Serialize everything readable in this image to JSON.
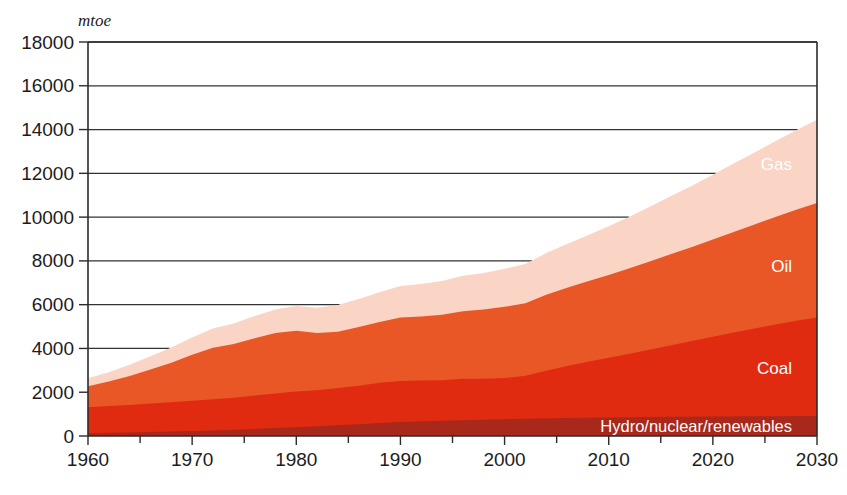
{
  "chart_data": {
    "type": "area",
    "stacked": true,
    "title": "",
    "subtitle": "",
    "xlabel": "",
    "ylabel": "mtoe",
    "unit_label": "mtoe",
    "xlim": [
      1960,
      2030
    ],
    "ylim": [
      0,
      18000
    ],
    "grid": true,
    "legend_position": "inline-right",
    "x_ticks": [
      1960,
      1970,
      1980,
      1990,
      2000,
      2010,
      2020,
      2030
    ],
    "x_tick_labels": [
      "1960",
      "1970",
      "1980",
      "1990",
      "2000",
      "2010",
      "2020",
      "2030"
    ],
    "x_minor_ticks": [
      1965,
      1975,
      1985,
      1995,
      2005,
      2015,
      2025
    ],
    "y_ticks": [
      0,
      2000,
      4000,
      6000,
      8000,
      10000,
      12000,
      14000,
      16000,
      18000
    ],
    "y_tick_labels": [
      "0",
      "2000",
      "4000",
      "6000",
      "8000",
      "10000",
      "12000",
      "14000",
      "16000",
      "18000"
    ],
    "x": [
      1960,
      1962,
      1964,
      1966,
      1968,
      1970,
      1972,
      1974,
      1976,
      1978,
      1980,
      1982,
      1984,
      1986,
      1988,
      1990,
      1992,
      1994,
      1996,
      1998,
      2000,
      2002,
      2004,
      2006,
      2008,
      2010,
      2012,
      2014,
      2016,
      2018,
      2020,
      2022,
      2024,
      2026,
      2028,
      2030
    ],
    "series": [
      {
        "name": "Hydro/nuclear/renewables",
        "label": "Hydro/nuclear/renewables",
        "color": "#a8281c",
        "values": [
          130,
          145,
          160,
          180,
          200,
          225,
          250,
          280,
          320,
          360,
          400,
          440,
          490,
          540,
          590,
          640,
          670,
          700,
          720,
          745,
          770,
          790,
          805,
          820,
          835,
          850,
          860,
          870,
          880,
          885,
          890,
          895,
          900,
          905,
          910,
          915
        ]
      },
      {
        "name": "Coal",
        "label": "Coal",
        "color": "#e02b10",
        "values": [
          1180,
          1220,
          1260,
          1300,
          1340,
          1390,
          1430,
          1470,
          1530,
          1580,
          1630,
          1650,
          1700,
          1760,
          1840,
          1870,
          1860,
          1850,
          1890,
          1870,
          1880,
          1960,
          2180,
          2380,
          2560,
          2720,
          2900,
          3080,
          3270,
          3450,
          3640,
          3830,
          4010,
          4190,
          4360,
          4500
        ]
      },
      {
        "name": "Oil",
        "label": "Oil",
        "color": "#ea5726",
        "values": [
          960,
          1120,
          1320,
          1560,
          1810,
          2100,
          2350,
          2450,
          2620,
          2760,
          2780,
          2620,
          2570,
          2680,
          2780,
          2900,
          2930,
          2990,
          3090,
          3160,
          3250,
          3310,
          3470,
          3570,
          3670,
          3780,
          3900,
          4030,
          4160,
          4300,
          4450,
          4600,
          4750,
          4910,
          5070,
          5230
        ]
      },
      {
        "name": "Gas",
        "label": "Gas",
        "color": "#fad4c4",
        "values": [
          370,
          430,
          510,
          600,
          690,
          790,
          880,
          940,
          1010,
          1080,
          1130,
          1150,
          1220,
          1280,
          1360,
          1440,
          1480,
          1540,
          1620,
          1670,
          1740,
          1800,
          1900,
          2000,
          2110,
          2230,
          2360,
          2500,
          2650,
          2800,
          2960,
          3120,
          3290,
          3460,
          3630,
          3800
        ]
      }
    ],
    "totals_note": "",
    "annotations": []
  },
  "figure": {
    "background_color": "#ffffff",
    "axis_color": "#2b2b2b",
    "grid_color": "#333333",
    "label_text_color": "#1c1c1c"
  }
}
